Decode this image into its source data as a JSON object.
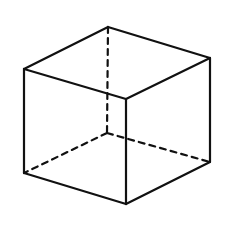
{
  "diagram": {
    "type": "cube-wireframe",
    "stroke_color": "#111111",
    "background": "#ffffff",
    "vertices": {
      "top_back": [
        108,
        27
      ],
      "top_left": [
        24,
        69
      ],
      "top_right": [
        210,
        58
      ],
      "top_front": [
        126,
        99
      ],
      "bottom_left": [
        24,
        173
      ],
      "bottom_right": [
        210,
        162
      ],
      "bottom_front": [
        126,
        204
      ],
      "bottom_back_hidden": [
        107,
        133
      ]
    },
    "edges_solid": [
      [
        "top_back",
        "top_left"
      ],
      [
        "top_back",
        "top_right"
      ],
      [
        "top_left",
        "top_front"
      ],
      [
        "top_right",
        "top_front"
      ],
      [
        "top_left",
        "bottom_left"
      ],
      [
        "top_front",
        "bottom_front"
      ],
      [
        "top_right",
        "bottom_right"
      ],
      [
        "bottom_left",
        "bottom_front"
      ],
      [
        "bottom_front",
        "bottom_right"
      ]
    ],
    "edges_dashed": [
      [
        "top_back",
        "bottom_back_hidden"
      ],
      [
        "bottom_back_hidden",
        "bottom_left"
      ],
      [
        "bottom_back_hidden",
        "bottom_right"
      ]
    ]
  }
}
